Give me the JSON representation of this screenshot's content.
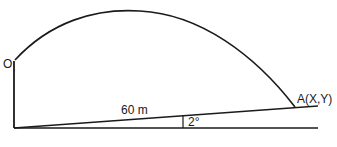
{
  "diagram": {
    "origin_label": "O",
    "point_label": "A(X,Y)",
    "distance_label": "60 m",
    "angle_label": "2°",
    "line_color": "#1a1a1a",
    "background": "#ffffff"
  }
}
